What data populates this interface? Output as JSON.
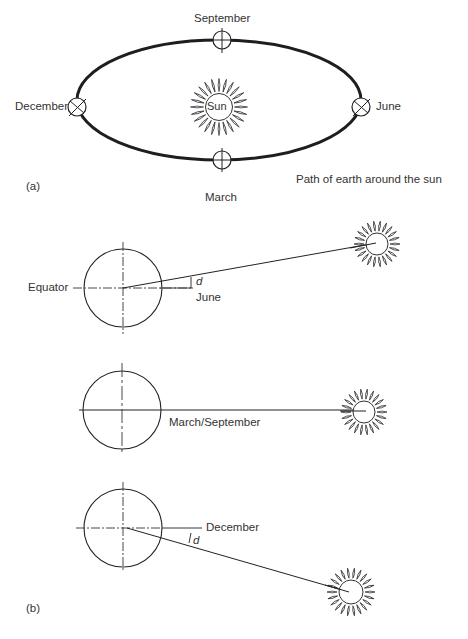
{
  "panel_a": {
    "label": "(a)",
    "caption": "Path of earth around the sun",
    "sun_label": "Sun",
    "positions": [
      {
        "name": "September",
        "side": "top"
      },
      {
        "name": "December",
        "side": "left"
      },
      {
        "name": "June",
        "side": "right"
      },
      {
        "name": "March",
        "side": "bottom"
      }
    ]
  },
  "panel_b": {
    "label": "(b)",
    "diagrams": [
      {
        "season": "June",
        "equator_label": "Equator",
        "angle_label": "d",
        "sun_position": "above equator"
      },
      {
        "season": "March/September",
        "sun_position": "in equator plane"
      },
      {
        "season": "December",
        "angle_label": "d",
        "sun_position": "below equator"
      }
    ]
  },
  "colors": {
    "line": "#222222",
    "text": "#333333",
    "background": "#ffffff"
  }
}
